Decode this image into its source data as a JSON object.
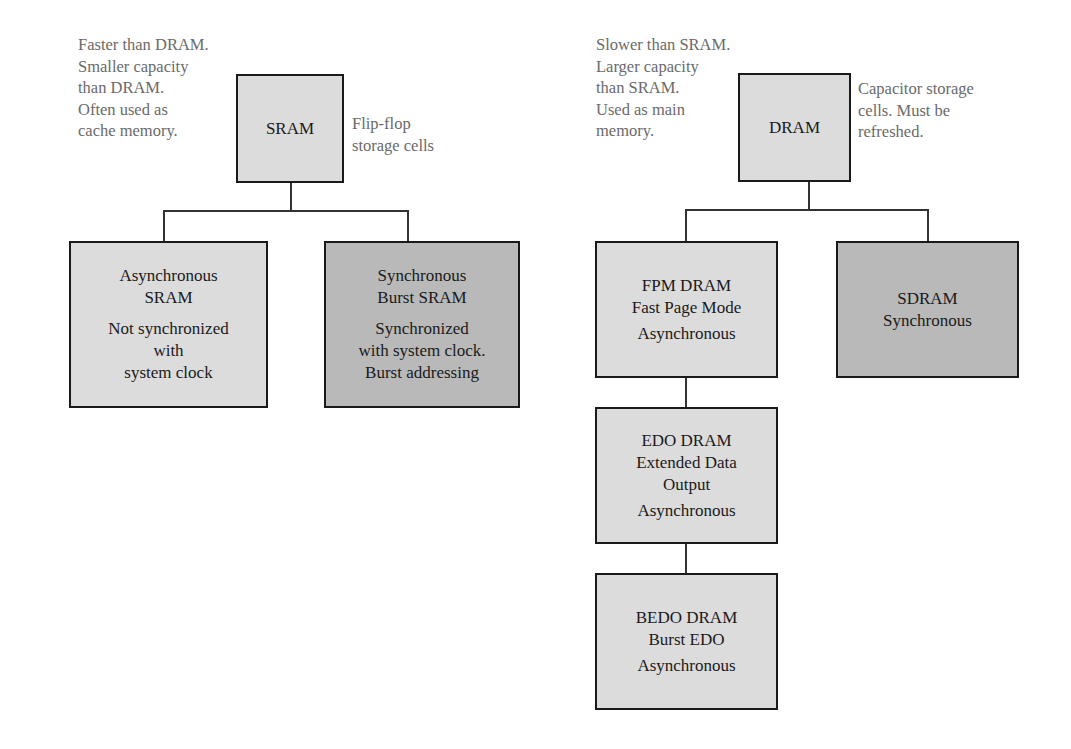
{
  "sram": {
    "title": "SRAM",
    "left_note": "Faster than DRAM.\nSmaller capacity\nthan DRAM.\nOften used as\ncache memory.",
    "right_note": "Flip-flop\nstorage cells",
    "children": [
      {
        "name": "Asynchronous\nSRAM",
        "desc": "Not synchronized\nwith\nsystem clock",
        "shade": "light"
      },
      {
        "name": "Synchronous\nBurst SRAM",
        "desc": "Synchronized\nwith system clock.\nBurst addressing",
        "shade": "dark"
      }
    ]
  },
  "dram": {
    "title": "DRAM",
    "left_note": "Slower than SRAM.\nLarger capacity\nthan SRAM.\nUsed as main\nmemory.",
    "right_note": "Capacitor storage\ncells. Must be\nrefreshed.",
    "children": [
      {
        "name": "FPM DRAM\nFast Page Mode",
        "desc": "Asynchronous",
        "shade": "light"
      },
      {
        "name": "SDRAM",
        "desc": "Synchronous",
        "shade": "dark"
      },
      {
        "name": "EDO DRAM\nExtended Data\nOutput",
        "desc": "Asynchronous",
        "shade": "light"
      },
      {
        "name": "BEDO DRAM\nBurst EDO",
        "desc": "Asynchronous",
        "shade": "light"
      }
    ]
  },
  "colors": {
    "light_box": "#dcdcdc",
    "dark_box": "#b9b9b9",
    "border": "#1a1a1a",
    "note_text": "#6a6a6a"
  }
}
